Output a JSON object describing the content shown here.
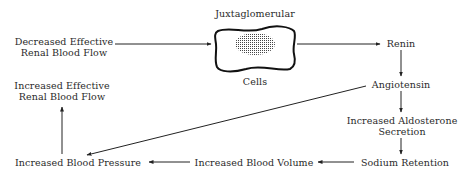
{
  "diagram": {
    "nodes": {
      "decreased_flow": {
        "line1": "Decreased Effective",
        "line2": "Renal Blood Flow"
      },
      "jg_top": "Juxtaglomerular",
      "jg_bottom": "Cells",
      "renin": "Renin",
      "angiotensin": "Angiotensin",
      "aldosterone": {
        "line1": "Increased Aldosterone",
        "line2": "Secretion"
      },
      "sodium": "Sodium Retention",
      "blood_volume": "Increased Blood Volume",
      "blood_pressure": "Increased Blood Pressure",
      "increased_flow": {
        "line1": "Increased Effective",
        "line2": "Renal Blood Flow"
      }
    },
    "edges": [
      {
        "from": "Decreased Effective Renal Blood Flow",
        "to": "Juxtaglomerular Cells"
      },
      {
        "from": "Juxtaglomerular Cells",
        "to": "Renin"
      },
      {
        "from": "Renin",
        "to": "Angiotensin"
      },
      {
        "from": "Angiotensin",
        "to": "Increased Aldosterone Secretion"
      },
      {
        "from": "Angiotensin",
        "to": "Increased Blood Pressure"
      },
      {
        "from": "Increased Aldosterone Secretion",
        "to": "Sodium Retention"
      },
      {
        "from": "Sodium Retention",
        "to": "Increased Blood Volume"
      },
      {
        "from": "Increased Blood Volume",
        "to": "Increased Blood Pressure"
      },
      {
        "from": "Increased Blood Pressure",
        "to": "Increased Effective Renal Blood Flow"
      }
    ]
  }
}
